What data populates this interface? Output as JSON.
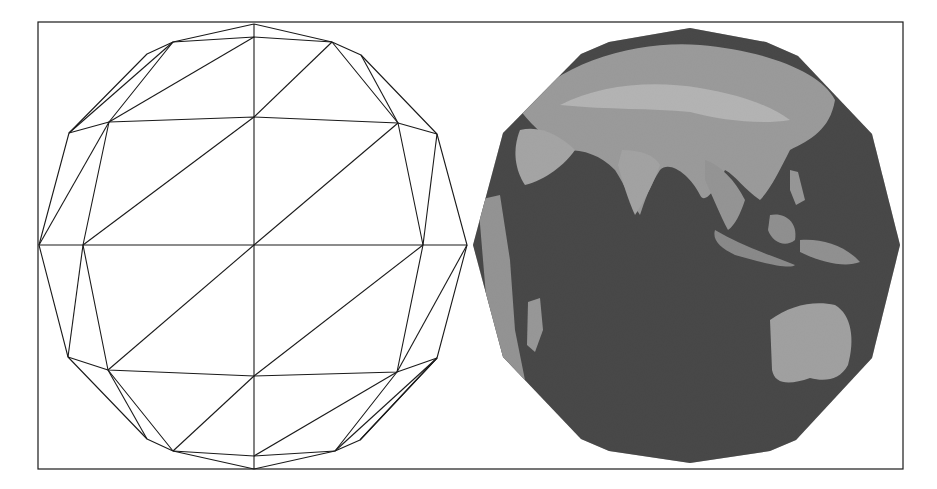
{
  "figure": {
    "panels": [
      {
        "name": "wireframe-sphere-mesh",
        "description": "triangulated sphere wireframe"
      },
      {
        "name": "textured-earth-mesh",
        "description": "same mesh rendered with earth texture (Asia, Indian Ocean, Australia)"
      }
    ]
  },
  "colors": {
    "stroke": "#1a1a1a",
    "ocean": "#2a2a2a",
    "land": "#a8a8a8",
    "land_light": "#cfcfcf",
    "background": "#ffffff"
  }
}
